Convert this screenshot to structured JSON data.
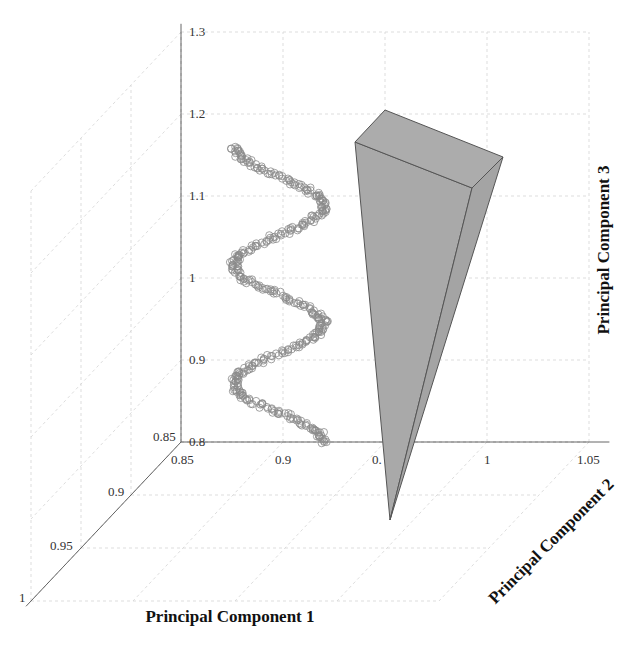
{
  "chart_data": {
    "type": "scatter3d",
    "title": "",
    "xlabel": "Principal Component 2",
    "ylabel": "Principal Component 1",
    "zlabel": "Principal Component 3",
    "axes": {
      "pc2": {
        "label": "Principal Component 2",
        "range": [
          0.85,
          1.05
        ],
        "ticks": [
          "0.85",
          "0.9",
          "0.95",
          "1",
          "1.05"
        ]
      },
      "pc1": {
        "label": "Principal Component 1",
        "range": [
          0.85,
          1.0
        ],
        "ticks": [
          "0.85",
          "0.9",
          "0.95",
          "1"
        ]
      },
      "pc3": {
        "label": "Principal Component 3",
        "range": [
          0.8,
          1.3
        ],
        "ticks": [
          "0.8",
          "0.9",
          "1",
          "1.1",
          "1.2",
          "1.3"
        ]
      }
    },
    "grid": true,
    "series": [
      {
        "name": "helix samples",
        "type": "scatter",
        "marker": "open-circle",
        "color": "#8a8a8a",
        "description": "Noisy sinusoidal helix: PC2 oscillates between ~0.875 and ~0.92 while PC3 rises from 0.8 to ~1.16 (about 2.5 periods)",
        "extremes": [
          {
            "pc2": 0.92,
            "pc3": 0.8
          },
          {
            "pc2": 0.876,
            "pc3": 0.89
          },
          {
            "pc2": 0.92,
            "pc3": 0.98
          },
          {
            "pc2": 0.876,
            "pc3": 1.06
          },
          {
            "pc2": 0.92,
            "pc3": 1.16
          }
        ]
      },
      {
        "name": "cone / wedge",
        "type": "surface",
        "color": "#a9a9a9",
        "edge_color": "#555555",
        "description": "Inverted gray wedge with apex near PC3≈0.7 and wide top near PC3≈1.16"
      }
    ]
  },
  "labels": {
    "pc1_title": "Principal Component 1",
    "pc2_title": "Principal Component 2",
    "pc3_title": "Principal Component 3",
    "z_ticks": [
      "0.8",
      "0.9",
      "1",
      "1.1",
      "1.2",
      "1.3"
    ],
    "x_ticks": [
      "0.85",
      "0.9",
      "0.",
      "1",
      "1.05"
    ],
    "y_ticks": [
      "0.85",
      "0.9",
      "0.95",
      "1"
    ]
  }
}
